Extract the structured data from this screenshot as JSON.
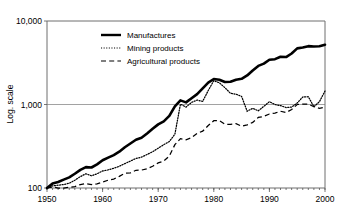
{
  "chart_data": {
    "type": "line",
    "title": "",
    "xlabel": "",
    "ylabel": "Log. scale",
    "log_y": true,
    "grid": true,
    "legend_position": "inside-top-left",
    "xlim": [
      1950,
      2000
    ],
    "ylim": [
      100,
      10000
    ],
    "x_ticks": [
      "1950",
      "1960",
      "1970",
      "1980",
      "1990",
      "2000"
    ],
    "x_tick_values": [
      1950,
      1960,
      1970,
      1980,
      1990,
      2000
    ],
    "y_ticks": [
      "100",
      "1,000",
      "10,000"
    ],
    "y_tick_values": [
      100,
      1000,
      10000
    ],
    "minor_x_ticks_annual": true,
    "x": [
      1950,
      1951,
      1952,
      1953,
      1954,
      1955,
      1956,
      1957,
      1958,
      1959,
      1960,
      1961,
      1962,
      1963,
      1964,
      1965,
      1966,
      1967,
      1968,
      1969,
      1970,
      1971,
      1972,
      1973,
      1974,
      1975,
      1976,
      1977,
      1978,
      1979,
      1980,
      1981,
      1982,
      1983,
      1984,
      1985,
      1986,
      1987,
      1988,
      1989,
      1990,
      1991,
      1992,
      1993,
      1994,
      1995,
      1996,
      1997,
      1998,
      1999,
      2000
    ],
    "series": [
      {
        "name": "Manufactures",
        "style": "solid",
        "values": [
          100,
          113,
          118,
          126,
          134,
          148,
          165,
          178,
          176,
          192,
          215,
          231,
          248,
          272,
          308,
          341,
          378,
          400,
          450,
          512,
          578,
          628,
          730,
          950,
          1120,
          1060,
          1190,
          1330,
          1560,
          1830,
          2020,
          1980,
          1860,
          1870,
          1980,
          2030,
          2230,
          2560,
          2900,
          3090,
          3440,
          3490,
          3730,
          3700,
          4080,
          4700,
          4820,
          5000,
          4950,
          4980,
          5200
        ]
      },
      {
        "name": "Mining products",
        "style": "dotted",
        "values": [
          100,
          106,
          108,
          110,
          114,
          124,
          137,
          148,
          140,
          148,
          160,
          165,
          172,
          182,
          196,
          210,
          226,
          234,
          252,
          272,
          300,
          330,
          360,
          440,
          1010,
          930,
          1060,
          1130,
          1090,
          1470,
          1930,
          1820,
          1590,
          1360,
          1330,
          1250,
          830,
          900,
          840,
          950,
          1080,
          1000,
          970,
          920,
          930,
          1040,
          1230,
          1240,
          940,
          1080,
          1450
        ]
      },
      {
        "name": "Agricultural products",
        "style": "dashed",
        "values": [
          100,
          103,
          100,
          99,
          102,
          104,
          110,
          113,
          110,
          112,
          118,
          124,
          128,
          138,
          150,
          152,
          163,
          164,
          170,
          182,
          200,
          210,
          242,
          330,
          390,
          378,
          400,
          450,
          480,
          560,
          640,
          640,
          580,
          580,
          590,
          550,
          570,
          610,
          700,
          720,
          770,
          790,
          830,
          800,
          870,
          1000,
          1010,
          1010,
          940,
          900,
          930
        ]
      }
    ]
  },
  "legend": {
    "items": [
      {
        "label": "Manufactures",
        "style": "solid"
      },
      {
        "label": "Mining products",
        "style": "dotted"
      },
      {
        "label": "Agricultural products",
        "style": "dashed"
      }
    ]
  }
}
